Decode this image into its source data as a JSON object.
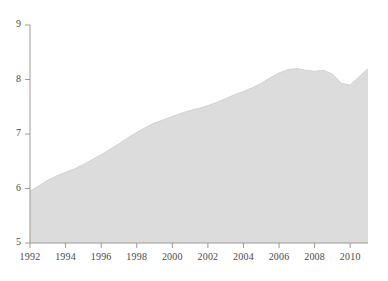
{
  "chart_data": {
    "type": "area",
    "title": "",
    "subtitle": "",
    "xlabel": "",
    "ylabel": "",
    "xlim": [
      1992,
      2011
    ],
    "ylim": [
      5,
      9
    ],
    "grid": false,
    "legend": null,
    "fill_color": "#dcdcdc",
    "line_color": "#d2d2d2",
    "axis_color": "#9a9a9a",
    "text_color": "#4a4a4a",
    "background_color": "#ffffff",
    "y_ticks": [
      5,
      6,
      7,
      8,
      9
    ],
    "y_tick_labels": [
      "5",
      "6",
      "7",
      "8",
      "9"
    ],
    "x_ticks": [
      1992,
      1994,
      1996,
      1998,
      2000,
      2002,
      2004,
      2006,
      2008,
      2010
    ],
    "x_tick_labels": [
      "1992",
      "1994",
      "1996",
      "1998",
      "2000",
      "2002",
      "2004",
      "2006",
      "2008",
      "2010"
    ],
    "x": [
      1992,
      1992.5,
      1993,
      1993.5,
      1994,
      1994.5,
      1995,
      1995.5,
      1996,
      1996.5,
      1997,
      1997.5,
      1998,
      1998.5,
      1999,
      1999.5,
      2000,
      2000.5,
      2001,
      2001.5,
      2002,
      2002.5,
      2003,
      2003.5,
      2004,
      2004.5,
      2005,
      2005.5,
      2006,
      2006.5,
      2007,
      2007.5,
      2008,
      2008.5,
      2009,
      2009.5,
      2010,
      2010.5,
      2011
    ],
    "values": [
      5.95,
      6.05,
      6.15,
      6.23,
      6.3,
      6.36,
      6.44,
      6.53,
      6.62,
      6.72,
      6.82,
      6.93,
      7.03,
      7.12,
      7.2,
      7.26,
      7.32,
      7.38,
      7.43,
      7.47,
      7.52,
      7.58,
      7.65,
      7.72,
      7.78,
      7.85,
      7.93,
      8.03,
      8.12,
      8.18,
      8.2,
      8.17,
      8.15,
      8.17,
      8.1,
      7.93,
      7.9,
      8.05,
      8.2
    ],
    "series": [
      {
        "name": "value",
        "values": [
          5.95,
          6.05,
          6.15,
          6.23,
          6.3,
          6.36,
          6.44,
          6.53,
          6.62,
          6.72,
          6.82,
          6.93,
          7.03,
          7.12,
          7.2,
          7.26,
          7.32,
          7.38,
          7.43,
          7.47,
          7.52,
          7.58,
          7.65,
          7.72,
          7.78,
          7.85,
          7.93,
          8.03,
          8.12,
          8.18,
          8.2,
          8.17,
          8.15,
          8.17,
          8.1,
          7.93,
          7.9,
          8.05,
          8.2
        ]
      }
    ],
    "annotations": []
  },
  "layout": {
    "plot_left": 30,
    "plot_right": 368,
    "plot_top": 25,
    "plot_bottom": 243,
    "tick_length": 5
  }
}
